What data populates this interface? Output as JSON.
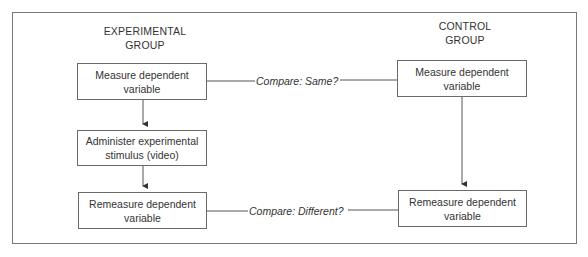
{
  "diagram": {
    "groups": {
      "experimental": {
        "title_line1": "EXPERIMENTAL",
        "title_line2": "GROUP"
      },
      "control": {
        "title_line1": "CONTROL",
        "title_line2": "GROUP"
      }
    },
    "experimental_steps": [
      {
        "line1": "Measure dependent",
        "line2": "variable"
      },
      {
        "line1": "Administer experimental",
        "line2": "stimulus (video)"
      },
      {
        "line1": "Remeasure dependent",
        "line2": "variable"
      }
    ],
    "control_steps": [
      {
        "line1": "Measure dependent",
        "line2": "variable"
      },
      {
        "line1": "Remeasure dependent",
        "line2": "variable"
      }
    ],
    "comparisons": [
      {
        "label": "Compare: Same?"
      },
      {
        "label": "Compare: Different?"
      }
    ]
  }
}
